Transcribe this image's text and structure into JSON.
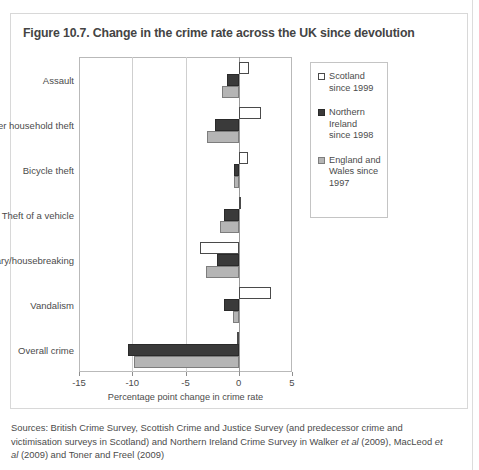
{
  "figure": {
    "title": "Figure 10.7. Change in the crime rate across the UK since devolution",
    "sources_prefix": "Sources: British Crime Survey, Scottish Crime and Justice Survey (and predecessor crime and victimisation surveys in Scotland) and Northern Ireland Crime Survey in Walker ",
    "sources_italic_1": "et al",
    "sources_mid": " (2009), MacLeod ",
    "sources_italic_2": "et al",
    "sources_suffix": " (2009) and Toner and Freel (2009)"
  },
  "legend": {
    "items": [
      {
        "key": "scotland",
        "label": "Scotland since 1999",
        "color": "#ffffff"
      },
      {
        "key": "ni",
        "label": "Northern Ireland since 1998",
        "color": "#3a3a3a"
      },
      {
        "key": "ew",
        "label": "England and Wales since 1997",
        "color": "#b5b5b5"
      }
    ]
  },
  "chart_data": {
    "type": "bar",
    "orientation": "horizontal",
    "title": "Figure 10.7. Change in the crime rate across the UK since devolution",
    "xlabel": "Percentage point change in crime rate",
    "ylabel": "",
    "xlim": [
      -15,
      5
    ],
    "xticks": [
      -15,
      -10,
      -5,
      0,
      5
    ],
    "xticklabels": [
      "-15",
      "-10",
      "-5",
      "0",
      "5"
    ],
    "grid": true,
    "legend_position": "right",
    "categories": [
      "Assault",
      "Other household theft",
      "Bicycle theft",
      "Theft of a vehicle",
      "Burglary/housebreaking",
      "Vandalism",
      "Overall crime"
    ],
    "series": [
      {
        "name": "Scotland since 1999",
        "color": "#ffffff",
        "values": [
          1.0,
          2.1,
          0.9,
          0.2,
          -3.6,
          3.0,
          -0.2
        ]
      },
      {
        "name": "Northern Ireland since 1998",
        "color": "#3a3a3a",
        "values": [
          -1.1,
          -2.2,
          -0.4,
          -1.4,
          -2.0,
          -1.4,
          -10.4
        ]
      },
      {
        "name": "England and Wales since 1997",
        "color": "#b5b5b5",
        "values": [
          -1.6,
          -3.0,
          -0.4,
          -1.8,
          -3.1,
          -0.5,
          -9.8
        ]
      }
    ]
  }
}
